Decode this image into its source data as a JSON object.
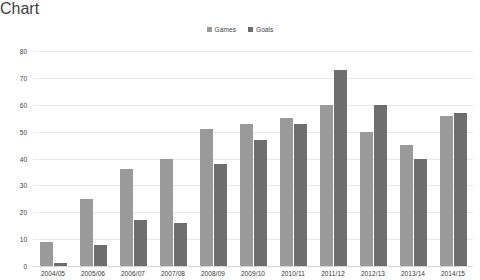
{
  "chart_data": {
    "type": "bar",
    "title": "",
    "subtitle": "",
    "xlabel": "",
    "ylabel": "",
    "ylim": [
      0,
      80
    ],
    "ytick_step": 10,
    "yticks": [
      "80",
      "70",
      "60",
      "50",
      "40",
      "30",
      "20",
      "10",
      "0"
    ],
    "grid": true,
    "legend_position": "top-center",
    "categories": [
      "2004/05",
      "2005/06",
      "2006/07",
      "2007/08",
      "2008/09",
      "2009/10",
      "2010/11",
      "2011/12",
      "2012/13",
      "2013/14",
      "2014/15"
    ],
    "series": [
      {
        "name": "Games",
        "color": "#9a9a9a",
        "values": [
          9,
          25,
          36,
          40,
          51,
          53,
          55,
          60,
          50,
          45,
          56
        ]
      },
      {
        "name": "Goals",
        "color": "#6e6e6e",
        "values": [
          1,
          8,
          17,
          16,
          38,
          47,
          53,
          73,
          60,
          40,
          57
        ]
      }
    ]
  },
  "colors": {
    "background": "#ffffff",
    "gridline": "#e9e9e9",
    "axis_line": "#d6d6d6",
    "text": "#404040",
    "series_games": "#9a9a9a",
    "series_goals": "#6e6e6e"
  }
}
